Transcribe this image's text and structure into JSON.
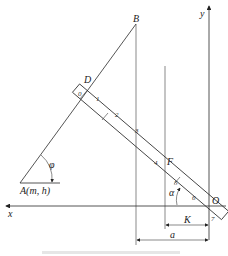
{
  "figure": {
    "labels": {
      "B": "B",
      "D": "D",
      "F": "F",
      "O": "O",
      "A": "A(m, h)",
      "x_axis": "x",
      "y_axis": "y",
      "phi": "φ",
      "alpha": "α",
      "K": "K",
      "a": "a"
    },
    "scale_marks": [
      "0",
      "1",
      "2",
      "3",
      "4",
      "5",
      "6",
      "7"
    ],
    "caption": ""
  }
}
